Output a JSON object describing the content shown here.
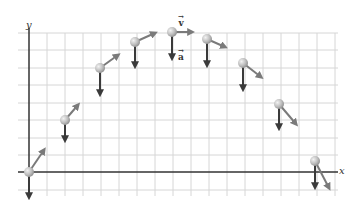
{
  "diagram": {
    "title": "",
    "axes": {
      "x_label": "x",
      "y_label": "y",
      "origin_px": [
        29,
        172
      ],
      "axis_color": "#333333"
    },
    "grid": {
      "color": "#d6d6d6",
      "vertical_lines_px": [
        47,
        65,
        83,
        101,
        119,
        137,
        155,
        173,
        191,
        209,
        227,
        245,
        263,
        281,
        299,
        317,
        335
      ],
      "horizontal_lines_px": [
        33,
        50,
        68,
        85,
        103,
        120,
        138,
        155,
        190
      ],
      "x_range_px": [
        18,
        338
      ],
      "y_range_px": [
        33,
        196
      ]
    },
    "vector_labels": {
      "velocity": "v",
      "acceleration": "a",
      "arrow": "→"
    },
    "colors": {
      "ball": "#b8b8b8",
      "ball_highlight": "#eeeeee",
      "velocity_arrow": "#7a7a7a",
      "acceleration_arrow": "#3a3a3a"
    },
    "projectile_positions": [
      {
        "ball": [
          29,
          172
        ],
        "v_tip": [
          44,
          150
        ],
        "a_tip": [
          29,
          197
        ]
      },
      {
        "ball": [
          65,
          120
        ],
        "v_tip": [
          78,
          105
        ],
        "a_tip": [
          65,
          140
        ]
      },
      {
        "ball": [
          100,
          68
        ],
        "v_tip": [
          118,
          55
        ],
        "a_tip": [
          100,
          94
        ]
      },
      {
        "ball": [
          135,
          42
        ],
        "v_tip": [
          155,
          33
        ],
        "a_tip": [
          135,
          66
        ]
      },
      {
        "ball": [
          172,
          32
        ],
        "v_tip": [
          192,
          32
        ],
        "a_tip": [
          172,
          58
        ]
      },
      {
        "ball": [
          207,
          39
        ],
        "v_tip": [
          225,
          47
        ],
        "a_tip": [
          207,
          65
        ]
      },
      {
        "ball": [
          243,
          63
        ],
        "v_tip": [
          261,
          77
        ],
        "a_tip": [
          243,
          89
        ]
      },
      {
        "ball": [
          279,
          104
        ],
        "v_tip": [
          296,
          124
        ],
        "a_tip": [
          279,
          128
        ]
      },
      {
        "ball": [
          315,
          161
        ],
        "v_tip": [
          329,
          188
        ],
        "a_tip": [
          315,
          187
        ]
      }
    ]
  }
}
